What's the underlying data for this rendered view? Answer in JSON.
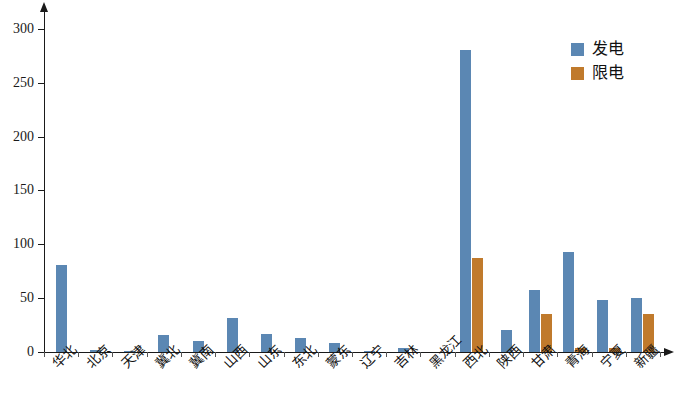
{
  "chart_data": {
    "type": "bar",
    "title": "",
    "subtitle": "",
    "xlabel": "",
    "ylabel": "",
    "ylim": [
      0,
      310
    ],
    "yticks": [
      0,
      50,
      100,
      150,
      200,
      250,
      300
    ],
    "ytick_labels": [
      "0",
      "50",
      "100",
      "150",
      "200",
      "250",
      "300"
    ],
    "grid": false,
    "legend_position": "top-right",
    "categories": [
      "华北",
      "北京",
      "天津",
      "冀北",
      "冀南",
      "山西",
      "山东",
      "东北",
      "蒙东",
      "辽宁",
      "吉林",
      "黑龙江",
      "西北",
      "陕西",
      "甘肃",
      "青海",
      "宁夏",
      "新疆"
    ],
    "series": [
      {
        "name": "发电",
        "color": "#5b87b3",
        "values": [
          81,
          2,
          1,
          16,
          10,
          32,
          17,
          13,
          8,
          1,
          4,
          0,
          280,
          20,
          58,
          93,
          48,
          50
        ]
      },
      {
        "name": "限电",
        "color": "#c07a2c",
        "values": [
          0,
          0,
          0,
          0,
          0,
          0,
          0,
          0,
          0,
          0,
          0,
          0,
          87,
          0,
          35,
          4,
          4,
          35
        ]
      }
    ]
  },
  "legend": {
    "items": [
      {
        "label": "发电",
        "swatch": "legend-swatch-blue"
      },
      {
        "label": "限电",
        "swatch": "legend-swatch-orange"
      }
    ]
  },
  "axes": {
    "y_axis_name": "y-axis",
    "x_axis_name": "x-axis"
  }
}
